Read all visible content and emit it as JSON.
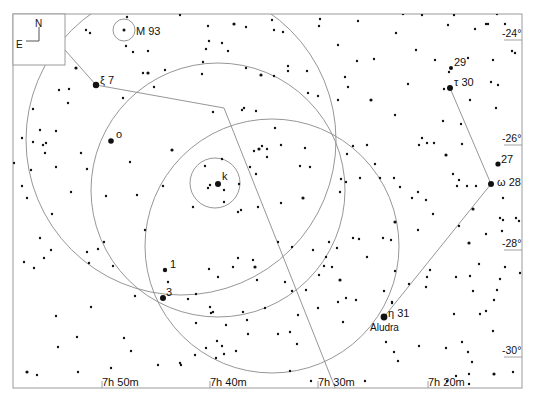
{
  "chart_data": {
    "type": "scatter",
    "frame": {
      "x": 13,
      "y": 14,
      "width": 509,
      "height": 374
    },
    "orientation": {
      "north_label": "N",
      "east_label": "E"
    },
    "ra_ticks": [
      {
        "label": "7h 50m",
        "x": 102
      },
      {
        "label": "7h 40m",
        "x": 210
      },
      {
        "label": "7h 30m",
        "x": 318
      },
      {
        "label": "7h 20m",
        "x": 428
      }
    ],
    "dec_ticks": [
      {
        "label": "-24°",
        "y": 36
      },
      {
        "label": "-26°",
        "y": 141
      },
      {
        "label": "-28°",
        "y": 246
      },
      {
        "label": "-30°",
        "y": 353
      }
    ],
    "circles": [
      {
        "name": "m93-marker",
        "cx": 124,
        "cy": 30,
        "r": 11
      },
      {
        "name": "field-circle-1",
        "cx": 181,
        "cy": 140,
        "r": 155
      },
      {
        "name": "field-circle-2",
        "cx": 218,
        "cy": 190,
        "r": 127
      },
      {
        "name": "field-circle-3",
        "cx": 272,
        "cy": 246,
        "r": 127
      },
      {
        "name": "cluster-circle",
        "cx": 215,
        "cy": 183,
        "r": 25
      }
    ],
    "lines": [
      {
        "name": "xi-to-frame-corner",
        "points": [
          [
            65,
            50
          ],
          [
            96,
            85
          ]
        ]
      },
      {
        "name": "xi-to-star",
        "points": [
          [
            96,
            85
          ],
          [
            224,
            108
          ]
        ]
      },
      {
        "name": "star-to-bottom",
        "points": [
          [
            224,
            108
          ],
          [
            340,
            400
          ]
        ]
      },
      {
        "name": "tau-to-omega",
        "points": [
          [
            450,
            88
          ],
          [
            491,
            184
          ]
        ]
      },
      {
        "name": "omega-to-eta",
        "points": [
          [
            491,
            184
          ],
          [
            384,
            317
          ]
        ]
      }
    ],
    "labeled_stars": [
      {
        "label": "M 93",
        "x": 124,
        "y": 30,
        "size": 1.5,
        "lx": 136,
        "ly": 35
      },
      {
        "label": "ξ 7",
        "x": 96,
        "y": 85,
        "size": 3.2,
        "lx": 100,
        "ly": 84
      },
      {
        "label": "o",
        "x": 111,
        "y": 141,
        "size": 2.8,
        "lx": 116,
        "ly": 138
      },
      {
        "label": "k",
        "x": 218,
        "y": 184,
        "size": 3.0,
        "lx": 222,
        "ly": 180
      },
      {
        "label": "1",
        "x": 165,
        "y": 270,
        "size": 2.2,
        "lx": 170,
        "ly": 268
      },
      {
        "label": "3",
        "x": 163,
        "y": 298,
        "size": 3.0,
        "lx": 166,
        "ly": 296
      },
      {
        "label": "29",
        "x": 451,
        "y": 68,
        "size": 2.0,
        "lx": 454,
        "ly": 66
      },
      {
        "label": "τ 30",
        "x": 450,
        "y": 88,
        "size": 3.0,
        "lx": 454,
        "ly": 86
      },
      {
        "label": "27",
        "x": 498,
        "y": 164,
        "size": 2.6,
        "lx": 501,
        "ly": 163
      },
      {
        "label": "ω 28",
        "x": 491,
        "y": 184,
        "size": 3.0,
        "lx": 497,
        "ly": 186
      },
      {
        "label": "η 31",
        "x": 384,
        "y": 317,
        "size": 3.4,
        "lx": 388,
        "ly": 317
      },
      {
        "label": "Aludra",
        "x": 384,
        "y": 317,
        "size": 0,
        "lx": 370,
        "ly": 331
      }
    ],
    "field_stars": [
      [
        127,
        17,
        1.2
      ],
      [
        86,
        30,
        1.2
      ],
      [
        90,
        33,
        1.2
      ],
      [
        126,
        46,
        1.2
      ],
      [
        133,
        52,
        1.2
      ],
      [
        148,
        51,
        1.2
      ],
      [
        76,
        68,
        1.6
      ],
      [
        143,
        73,
        1.2
      ],
      [
        148,
        73,
        1.6
      ],
      [
        165,
        70,
        1.2
      ],
      [
        154,
        87,
        1.2
      ],
      [
        59,
        90,
        1.2
      ],
      [
        69,
        89,
        1.2
      ],
      [
        68,
        103,
        1.2
      ],
      [
        33,
        109,
        1.2
      ],
      [
        123,
        98,
        1.2
      ],
      [
        234,
        24,
        1.6
      ],
      [
        246,
        27,
        1.2
      ],
      [
        272,
        20,
        1.2
      ],
      [
        274,
        30,
        1.2
      ],
      [
        283,
        32,
        1.2
      ],
      [
        320,
        19,
        1.2
      ],
      [
        319,
        26,
        1.2
      ],
      [
        358,
        21,
        1.2
      ],
      [
        338,
        45,
        1.2
      ],
      [
        357,
        61,
        1.2
      ],
      [
        374,
        59,
        1.2
      ],
      [
        396,
        33,
        1.2
      ],
      [
        228,
        51,
        1.2
      ],
      [
        209,
        41,
        1.2
      ],
      [
        206,
        49,
        1.2
      ],
      [
        202,
        74,
        1.2
      ],
      [
        203,
        62,
        1.2
      ],
      [
        246,
        68,
        1.2
      ],
      [
        288,
        66,
        1.2
      ],
      [
        308,
        93,
        1.2
      ],
      [
        318,
        96,
        1.2
      ],
      [
        338,
        100,
        1.2
      ],
      [
        345,
        77,
        1.2
      ],
      [
        348,
        87,
        1.2
      ],
      [
        371,
        100,
        1.6
      ],
      [
        395,
        115,
        1.2
      ],
      [
        288,
        71,
        1.2
      ],
      [
        307,
        71,
        1.2
      ],
      [
        261,
        75,
        1.6
      ],
      [
        274,
        76,
        1.2
      ],
      [
        222,
        43,
        1.2
      ],
      [
        208,
        26,
        1.2
      ],
      [
        180,
        15,
        1.2
      ],
      [
        242,
        110,
        1.2
      ],
      [
        244,
        108,
        1.2
      ],
      [
        256,
        111,
        1.2
      ],
      [
        213,
        112,
        1.2
      ],
      [
        403,
        14,
        1.2
      ],
      [
        422,
        15,
        1.2
      ],
      [
        454,
        15,
        1.2
      ],
      [
        497,
        14,
        1.2
      ],
      [
        448,
        25,
        1.2
      ],
      [
        475,
        29,
        1.2
      ],
      [
        486,
        24,
        1.2
      ],
      [
        488,
        24,
        1.2
      ],
      [
        505,
        24,
        1.2
      ],
      [
        512,
        51,
        1.2
      ],
      [
        515,
        53,
        1.2
      ],
      [
        416,
        50,
        1.2
      ],
      [
        435,
        60,
        1.2
      ],
      [
        468,
        58,
        1.2
      ],
      [
        493,
        60,
        1.2
      ],
      [
        449,
        72,
        1.2
      ],
      [
        408,
        84,
        1.2
      ],
      [
        444,
        89,
        1.2
      ],
      [
        491,
        82,
        1.2
      ],
      [
        498,
        85,
        1.2
      ],
      [
        470,
        100,
        1.2
      ],
      [
        496,
        108,
        1.2
      ],
      [
        443,
        121,
        1.2
      ],
      [
        40,
        130,
        1.2
      ],
      [
        33,
        142,
        1.2
      ],
      [
        43,
        145,
        1.2
      ],
      [
        46,
        143,
        1.2
      ],
      [
        45,
        153,
        1.2
      ],
      [
        56,
        167,
        1.2
      ],
      [
        14,
        163,
        1.2
      ],
      [
        22,
        138,
        1.2
      ],
      [
        56,
        131,
        1.2
      ],
      [
        31,
        170,
        1.2
      ],
      [
        22,
        186,
        1.2
      ],
      [
        27,
        198,
        1.2
      ],
      [
        52,
        214,
        1.2
      ],
      [
        40,
        238,
        1.2
      ],
      [
        51,
        250,
        1.2
      ],
      [
        44,
        258,
        1.2
      ],
      [
        24,
        262,
        1.2
      ],
      [
        34,
        268,
        1.2
      ],
      [
        89,
        263,
        1.2
      ],
      [
        98,
        249,
        1.2
      ],
      [
        87,
        252,
        1.2
      ],
      [
        113,
        266,
        1.2
      ],
      [
        104,
        242,
        1.2
      ],
      [
        71,
        192,
        1.2
      ],
      [
        87,
        169,
        1.2
      ],
      [
        81,
        153,
        1.2
      ],
      [
        106,
        196,
        1.2
      ],
      [
        137,
        195,
        1.2
      ],
      [
        145,
        230,
        1.2
      ],
      [
        172,
        150,
        1.6
      ],
      [
        163,
        186,
        1.2
      ],
      [
        130,
        162,
        1.2
      ],
      [
        222,
        159,
        1.2
      ],
      [
        205,
        166,
        1.2
      ],
      [
        208,
        188,
        1.2
      ],
      [
        210,
        185,
        1.2
      ],
      [
        224,
        190,
        1.2
      ],
      [
        239,
        184,
        1.2
      ],
      [
        224,
        202,
        1.2
      ],
      [
        193,
        207,
        1.2
      ],
      [
        241,
        210,
        1.2
      ],
      [
        258,
        207,
        1.2
      ],
      [
        238,
        212,
        1.2
      ],
      [
        259,
        149,
        1.6
      ],
      [
        262,
        146,
        1.2
      ],
      [
        267,
        149,
        1.2
      ],
      [
        254,
        151,
        1.2
      ],
      [
        256,
        174,
        1.2
      ],
      [
        267,
        157,
        1.2
      ],
      [
        250,
        167,
        1.2
      ],
      [
        233,
        267,
        1.2
      ],
      [
        238,
        258,
        1.2
      ],
      [
        218,
        277,
        1.2
      ],
      [
        209,
        269,
        1.2
      ],
      [
        255,
        267,
        1.6
      ],
      [
        253,
        260,
        1.2
      ],
      [
        257,
        280,
        1.2
      ],
      [
        275,
        128,
        1.2
      ],
      [
        281,
        145,
        1.2
      ],
      [
        305,
        148,
        1.2
      ],
      [
        281,
        203,
        1.2
      ],
      [
        303,
        198,
        1.6
      ],
      [
        278,
        242,
        1.2
      ],
      [
        300,
        166,
        1.2
      ],
      [
        310,
        167,
        1.2
      ],
      [
        341,
        179,
        1.2
      ],
      [
        340,
        192,
        1.2
      ],
      [
        346,
        182,
        1.2
      ],
      [
        375,
        164,
        1.2
      ],
      [
        380,
        178,
        1.2
      ],
      [
        394,
        178,
        1.2
      ],
      [
        400,
        187,
        1.2
      ],
      [
        412,
        198,
        1.2
      ],
      [
        353,
        146,
        1.2
      ],
      [
        347,
        154,
        1.2
      ],
      [
        360,
        178,
        1.2
      ],
      [
        367,
        145,
        1.2
      ],
      [
        337,
        248,
        1.2
      ],
      [
        329,
        242,
        1.2
      ],
      [
        326,
        257,
        1.2
      ],
      [
        313,
        250,
        1.2
      ],
      [
        292,
        247,
        1.2
      ],
      [
        367,
        257,
        1.2
      ],
      [
        332,
        267,
        1.2
      ],
      [
        324,
        266,
        1.2
      ],
      [
        353,
        238,
        1.2
      ],
      [
        359,
        239,
        1.2
      ],
      [
        383,
        238,
        1.2
      ],
      [
        391,
        240,
        1.2
      ],
      [
        395,
        222,
        1.6
      ],
      [
        426,
        200,
        1.2
      ],
      [
        418,
        230,
        1.2
      ],
      [
        433,
        214,
        1.2
      ],
      [
        459,
        226,
        1.2
      ],
      [
        418,
        192,
        1.2
      ],
      [
        419,
        145,
        1.2
      ],
      [
        422,
        138,
        1.2
      ],
      [
        461,
        124,
        1.2
      ],
      [
        462,
        144,
        1.2
      ],
      [
        427,
        143,
        1.2
      ],
      [
        459,
        180,
        1.2
      ],
      [
        467,
        186,
        1.2
      ],
      [
        469,
        243,
        1.6
      ],
      [
        486,
        234,
        1.2
      ],
      [
        500,
        218,
        1.2
      ],
      [
        503,
        220,
        1.2
      ],
      [
        503,
        198,
        1.2
      ],
      [
        473,
        209,
        1.6
      ],
      [
        516,
        218,
        1.2
      ],
      [
        502,
        231,
        1.2
      ],
      [
        519,
        221,
        1.2
      ],
      [
        434,
        143,
        1.2
      ],
      [
        446,
        155,
        1.6
      ],
      [
        453,
        174,
        1.2
      ],
      [
        457,
        186,
        1.2
      ],
      [
        476,
        186,
        1.2
      ],
      [
        188,
        299,
        1.2
      ],
      [
        196,
        294,
        1.2
      ],
      [
        210,
        307,
        1.2
      ],
      [
        213,
        312,
        1.2
      ],
      [
        211,
        313,
        1.2
      ],
      [
        243,
        312,
        1.2
      ],
      [
        247,
        320,
        1.2
      ],
      [
        196,
        323,
        1.2
      ],
      [
        222,
        346,
        1.2
      ],
      [
        236,
        351,
        1.2
      ],
      [
        206,
        348,
        1.2
      ],
      [
        216,
        358,
        1.2
      ],
      [
        224,
        354,
        1.2
      ],
      [
        226,
        325,
        1.2
      ],
      [
        217,
        341,
        1.2
      ],
      [
        195,
        355,
        1.2
      ],
      [
        248,
        334,
        1.2
      ],
      [
        298,
        315,
        1.2
      ],
      [
        265,
        308,
        1.2
      ],
      [
        292,
        291,
        1.2
      ],
      [
        290,
        332,
        1.2
      ],
      [
        278,
        334,
        1.2
      ],
      [
        343,
        322,
        1.2
      ],
      [
        318,
        308,
        1.2
      ],
      [
        306,
        290,
        1.2
      ],
      [
        338,
        302,
        1.2
      ],
      [
        297,
        344,
        1.2
      ],
      [
        346,
        298,
        1.2
      ],
      [
        340,
        280,
        1.6
      ],
      [
        319,
        275,
        1.2
      ],
      [
        285,
        282,
        1.2
      ],
      [
        135,
        296,
        1.2
      ],
      [
        91,
        307,
        1.2
      ],
      [
        56,
        316,
        1.2
      ],
      [
        77,
        337,
        1.2
      ],
      [
        58,
        347,
        1.2
      ],
      [
        124,
        338,
        1.2
      ],
      [
        131,
        351,
        1.2
      ],
      [
        111,
        368,
        1.2
      ],
      [
        158,
        365,
        1.2
      ],
      [
        181,
        365,
        1.2
      ],
      [
        180,
        363,
        1.2
      ],
      [
        27,
        372,
        1.6
      ],
      [
        37,
        375,
        1.2
      ],
      [
        78,
        372,
        1.2
      ],
      [
        168,
        282,
        1.2
      ],
      [
        290,
        371,
        1.2
      ],
      [
        311,
        381,
        1.2
      ],
      [
        365,
        381,
        1.2
      ],
      [
        356,
        300,
        1.2
      ],
      [
        384,
        291,
        1.2
      ],
      [
        392,
        303,
        1.2
      ],
      [
        392,
        302,
        1.2
      ],
      [
        394,
        352,
        1.2
      ],
      [
        398,
        361,
        1.2
      ],
      [
        386,
        342,
        1.2
      ],
      [
        419,
        346,
        1.2
      ],
      [
        446,
        348,
        1.2
      ],
      [
        454,
        314,
        1.2
      ],
      [
        462,
        342,
        1.2
      ],
      [
        468,
        352,
        1.2
      ],
      [
        472,
        362,
        1.2
      ],
      [
        469,
        374,
        1.2
      ],
      [
        456,
        376,
        1.2
      ],
      [
        447,
        381,
        1.2
      ],
      [
        469,
        384,
        1.2
      ],
      [
        494,
        374,
        1.6
      ],
      [
        513,
        372,
        1.2
      ],
      [
        493,
        331,
        1.2
      ],
      [
        480,
        314,
        1.2
      ],
      [
        494,
        300,
        1.2
      ],
      [
        497,
        290,
        1.2
      ],
      [
        500,
        279,
        1.2
      ],
      [
        505,
        267,
        1.2
      ],
      [
        479,
        264,
        1.2
      ],
      [
        486,
        311,
        1.2
      ],
      [
        520,
        273,
        1.2
      ],
      [
        473,
        291,
        1.2
      ],
      [
        395,
        271,
        1.2
      ],
      [
        409,
        284,
        1.2
      ],
      [
        426,
        287,
        1.2
      ],
      [
        430,
        270,
        1.2
      ],
      [
        427,
        277,
        1.2
      ],
      [
        456,
        277,
        1.2
      ],
      [
        470,
        276,
        1.2
      ]
    ]
  }
}
